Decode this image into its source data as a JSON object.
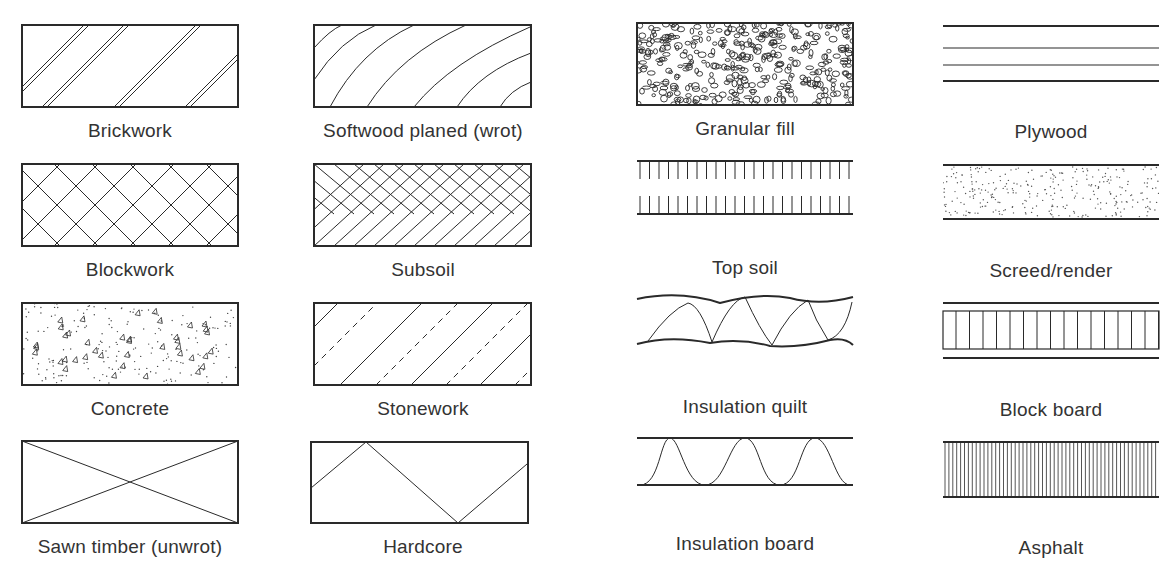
{
  "symbols": [
    {
      "id": "brickwork",
      "label": "Brickwork",
      "pattern": "double diagonal lines",
      "col": 0,
      "row": 0
    },
    {
      "id": "softwood",
      "label": "Softwood planed (wrot)",
      "pattern": "curved grain lines",
      "col": 1,
      "row": 0
    },
    {
      "id": "granular-fill",
      "label": "Granular fill",
      "pattern": "small pebbles",
      "col": 2,
      "row": 0
    },
    {
      "id": "plywood",
      "label": "Plywood",
      "pattern": "four horizontal lines",
      "col": 3,
      "row": 0
    },
    {
      "id": "blockwork",
      "label": "Blockwork",
      "pattern": "diagonal cross-hatch",
      "col": 0,
      "row": 1
    },
    {
      "id": "subsoil",
      "label": "Subsoil",
      "pattern": "herringbone diagonal bands",
      "col": 1,
      "row": 1
    },
    {
      "id": "top-soil",
      "label": "Top soil",
      "pattern": "two lines with vertical ticks",
      "col": 2,
      "row": 1
    },
    {
      "id": "screed",
      "label": "Screed/render",
      "pattern": "stippled dots between lines",
      "col": 3,
      "row": 1
    },
    {
      "id": "concrete",
      "label": "Concrete",
      "pattern": "triangles and dots",
      "col": 0,
      "row": 2
    },
    {
      "id": "stonework",
      "label": "Stonework",
      "pattern": "alternating solid and dashed diagonals",
      "col": 1,
      "row": 2
    },
    {
      "id": "insulation-quilt",
      "label": "Insulation quilt",
      "pattern": "wavy lines with loops",
      "col": 2,
      "row": 2
    },
    {
      "id": "block-board",
      "label": "Block board",
      "pattern": "vertical strips between lines",
      "col": 3,
      "row": 2
    },
    {
      "id": "sawn-timber",
      "label": "Sawn timber (unwrot)",
      "pattern": "diagonal cross (X)",
      "col": 0,
      "row": 3
    },
    {
      "id": "hardcore",
      "label": "Hardcore",
      "pattern": "zigzag line",
      "col": 1,
      "row": 3
    },
    {
      "id": "insulation-board",
      "label": "Insulation board",
      "pattern": "sine wave between lines",
      "col": 2,
      "row": 3
    },
    {
      "id": "asphalt",
      "label": "Asphalt",
      "pattern": "dense vertical lines",
      "col": 3,
      "row": 3
    }
  ],
  "colors": {
    "stroke": "#2a2a2a",
    "background": "#ffffff",
    "text": "#333333"
  }
}
